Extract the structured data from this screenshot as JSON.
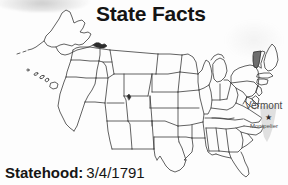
{
  "card": {
    "title": "State Facts",
    "fact_label": "Statehood:",
    "fact_value": "3/4/1791"
  },
  "callout": {
    "state_name": "Vermont",
    "capital_name": "Montpelier",
    "capital_marker": "★"
  },
  "map": {
    "type": "choropleth-outline",
    "region": "United States",
    "highlighted_state": "Vermont",
    "includes_alaska": true,
    "includes_hawaii": true,
    "outline_color": "#3a3a3a",
    "highlight_color": "#6e6e6e",
    "inset_silhouette_color": "#bdbdbd"
  },
  "colors": {
    "background": "#fdfdfd",
    "ink": "#151515",
    "label_gray": "#4a4a4a"
  }
}
